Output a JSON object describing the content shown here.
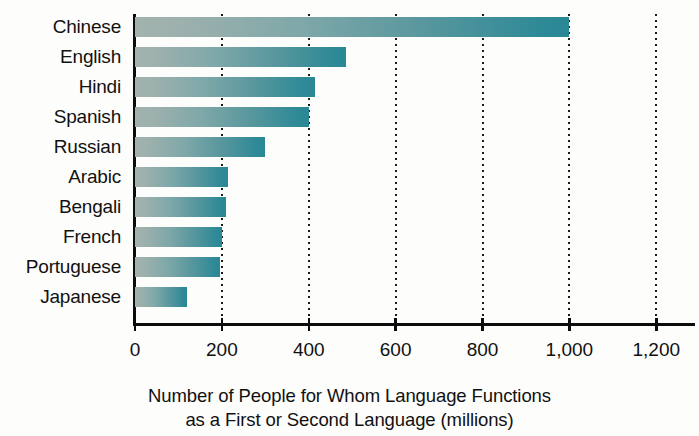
{
  "chart_data": {
    "type": "bar",
    "orientation": "horizontal",
    "title": "",
    "xlabel": "Number of People for Whom Language Functions as a First or Second Language (millions)",
    "xlabel_lines": [
      "Number of People for Whom Language Functions",
      "as a First or Second Language (millions)"
    ],
    "ylabel": "",
    "categories": [
      "Chinese",
      "English",
      "Hindi",
      "Spanish",
      "Russian",
      "Arabic",
      "Bengali",
      "French",
      "Portuguese",
      "Japanese"
    ],
    "values": [
      1000,
      485,
      415,
      400,
      300,
      215,
      210,
      200,
      195,
      120
    ],
    "units": "millions",
    "xlim": [
      0,
      1280
    ],
    "xticks": [
      0,
      200,
      400,
      600,
      800,
      1000,
      1200
    ],
    "xtick_labels": [
      "0",
      "200",
      "400",
      "600",
      "800",
      "1,000",
      "1,200"
    ],
    "grid": true,
    "grid_style": "dotted-vertical",
    "legend": false,
    "bar_gradient": {
      "from": "#a3b3ae",
      "to": "#2b8793"
    },
    "axis_color": "#0c0c0c",
    "background": "#fdfdfc"
  }
}
